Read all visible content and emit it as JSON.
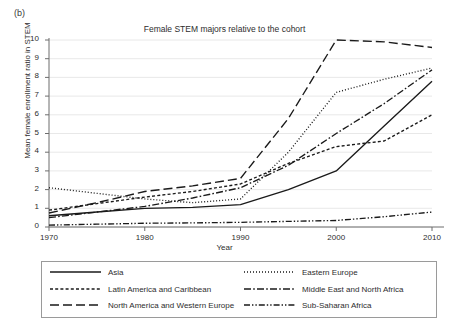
{
  "panel_label": "(b)",
  "axis": {
    "ylabel": "Mean female enrollment ratio in STEM",
    "xlabel": "Year",
    "yticks": [
      "0",
      "1",
      "2",
      "3",
      "4",
      "5",
      "6",
      "7",
      "8",
      "9",
      "10"
    ],
    "xticks": [
      "1970",
      "1980",
      "1990",
      "2000",
      "2010"
    ]
  },
  "legend": {
    "items": [
      {
        "label": "Asia",
        "style": "solid"
      },
      {
        "label": "Eastern Europe",
        "style": "dotted"
      },
      {
        "label": "Latin America and Caribbean",
        "style": "dashed-small"
      },
      {
        "label": "Middle East and North Africa",
        "style": "dash-dot"
      },
      {
        "label": "North America and Western Europe",
        "style": "dashed-long"
      },
      {
        "label": "Sub-Saharan Africa",
        "style": "dash-dot-dot"
      }
    ]
  },
  "chart_data": {
    "type": "line",
    "title": "Female STEM majors relative to the cohort",
    "xlabel": "Year",
    "ylabel": "Mean female enrollment ratio in STEM",
    "x": [
      1970,
      1975,
      1980,
      1985,
      1990,
      1995,
      2000,
      2005,
      2010
    ],
    "xlim": [
      1970,
      2010
    ],
    "ylim": [
      0,
      10
    ],
    "grid": true,
    "legend_position": "bottom",
    "series": [
      {
        "name": "Asia",
        "style": "solid",
        "values": [
          0.6,
          0.8,
          1.0,
          1.05,
          1.2,
          2.0,
          3.0,
          5.4,
          7.8
        ]
      },
      {
        "name": "Eastern Europe",
        "style": "dotted",
        "values": [
          2.1,
          1.8,
          1.5,
          1.3,
          1.5,
          4.0,
          7.2,
          7.9,
          8.5
        ]
      },
      {
        "name": "Latin America and Caribbean",
        "style": "dashed-small",
        "values": [
          0.9,
          1.25,
          1.6,
          1.9,
          2.3,
          3.4,
          4.3,
          4.6,
          6.0
        ]
      },
      {
        "name": "Middle East and North Africa",
        "style": "dash-dot",
        "values": [
          0.5,
          0.8,
          1.1,
          1.55,
          2.1,
          3.3,
          5.0,
          6.6,
          8.4
        ]
      },
      {
        "name": "North America and Western Europe",
        "style": "dashed-long",
        "values": [
          0.75,
          1.3,
          1.9,
          2.2,
          2.6,
          5.8,
          10.0,
          9.9,
          9.6
        ]
      },
      {
        "name": "Sub-Saharan Africa",
        "style": "dash-dot-dot",
        "values": [
          0.1,
          0.15,
          0.2,
          0.22,
          0.25,
          0.3,
          0.35,
          0.55,
          0.8
        ]
      }
    ]
  }
}
